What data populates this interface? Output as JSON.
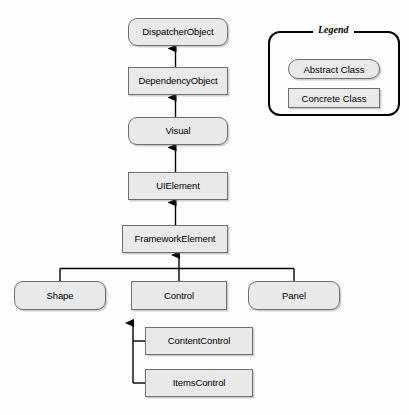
{
  "diagram": {
    "type": "class-hierarchy",
    "colors": {
      "node_fill": "#e9e9e9",
      "node_border": "#6f6f6f",
      "connector": "#000000",
      "legend_border": "#000000",
      "background": "#fdfdfd"
    },
    "nodes": [
      {
        "id": "dispatcherobject",
        "label": "DispatcherObject",
        "kind": "abstract",
        "x": 128,
        "y": 18,
        "w": 100,
        "h": 28
      },
      {
        "id": "dependencyobject",
        "label": "DependencyObject",
        "kind": "concrete",
        "x": 128,
        "y": 67,
        "w": 100,
        "h": 28
      },
      {
        "id": "visual",
        "label": "Visual",
        "kind": "abstract",
        "x": 128,
        "y": 117,
        "w": 100,
        "h": 28
      },
      {
        "id": "uielement",
        "label": "UIElement",
        "kind": "concrete",
        "x": 128,
        "y": 172,
        "w": 100,
        "h": 28
      },
      {
        "id": "frameworkelement",
        "label": "FrameworkElement",
        "kind": "concrete",
        "x": 122,
        "y": 225,
        "w": 106,
        "h": 28
      },
      {
        "id": "shape",
        "label": "Shape",
        "kind": "abstract",
        "x": 14,
        "y": 281,
        "w": 92,
        "h": 29
      },
      {
        "id": "control",
        "label": "Control",
        "kind": "concrete",
        "x": 131,
        "y": 281,
        "w": 96,
        "h": 29
      },
      {
        "id": "panel",
        "label": "Panel",
        "kind": "abstract",
        "x": 248,
        "y": 281,
        "w": 92,
        "h": 29
      },
      {
        "id": "contentcontrol",
        "label": "ContentControl",
        "kind": "concrete",
        "x": 145,
        "y": 327,
        "w": 108,
        "h": 28
      },
      {
        "id": "itemscontrol",
        "label": "ItemsControl",
        "kind": "concrete",
        "x": 145,
        "y": 369,
        "w": 108,
        "h": 28
      }
    ],
    "edges": [
      {
        "from": "dependencyobject",
        "to": "dispatcherobject",
        "style": "generalization"
      },
      {
        "from": "visual",
        "to": "dependencyobject",
        "style": "generalization"
      },
      {
        "from": "uielement",
        "to": "visual",
        "style": "generalization"
      },
      {
        "from": "frameworkelement",
        "to": "uielement",
        "style": "generalization"
      },
      {
        "from": "shape",
        "to": "frameworkelement",
        "style": "generalization-bus"
      },
      {
        "from": "control",
        "to": "frameworkelement",
        "style": "generalization-bus"
      },
      {
        "from": "panel",
        "to": "frameworkelement",
        "style": "generalization-bus"
      },
      {
        "from": "contentcontrol",
        "to": "control",
        "style": "generalization-spine"
      },
      {
        "from": "itemscontrol",
        "to": "control",
        "style": "generalization-spine"
      }
    ]
  },
  "legend": {
    "title": "Legend",
    "items": [
      {
        "id": "abstract",
        "label": "Abstract Class",
        "kind": "abstract"
      },
      {
        "id": "concrete",
        "label": "Concrete Class",
        "kind": "concrete"
      }
    ]
  }
}
